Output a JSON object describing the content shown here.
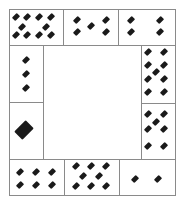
{
  "puzzle": {
    "description": "Ring of cards with diamond pips around an empty center",
    "pip_color": "#1a1a1a",
    "border_color": "#8a8a8a",
    "cards": [
      {
        "id": "top-left",
        "count": 10,
        "box": [
          9,
          9,
          55,
          37
        ],
        "pips": [
          [
            16,
            17
          ],
          [
            27,
            17
          ],
          [
            39,
            17
          ],
          [
            51,
            17
          ],
          [
            22,
            27
          ],
          [
            46,
            27
          ],
          [
            16,
            35
          ],
          [
            27,
            35
          ],
          [
            39,
            35
          ],
          [
            51,
            35
          ]
        ],
        "size": 6
      },
      {
        "id": "top-middle",
        "count": 5,
        "box": [
          63,
          9,
          56,
          37
        ],
        "pips": [
          [
            77,
            20
          ],
          [
            77,
            32
          ],
          [
            91,
            26
          ],
          [
            106,
            20
          ],
          [
            106,
            32
          ]
        ],
        "size": 6
      },
      {
        "id": "top-right",
        "count": 4,
        "box": [
          118,
          9,
          58,
          37
        ],
        "pips": [
          [
            131,
            20
          ],
          [
            131,
            32
          ],
          [
            160,
            20
          ],
          [
            160,
            32
          ]
        ],
        "size": 6
      },
      {
        "id": "left-upper",
        "count": 3,
        "box": [
          9,
          45,
          35,
          58
        ],
        "pips": [
          [
            26,
            60
          ],
          [
            26,
            74
          ],
          [
            26,
            88
          ]
        ],
        "size": 6
      },
      {
        "id": "left-lower",
        "count": 1,
        "box": [
          9,
          102,
          35,
          58
        ],
        "pips": [
          [
            24,
            130
          ]
        ],
        "size": 14
      },
      {
        "id": "right-upper",
        "count": 9,
        "box": [
          141,
          45,
          35,
          59
        ],
        "pips": [
          [
            148,
            52
          ],
          [
            148,
            65
          ],
          [
            148,
            79
          ],
          [
            148,
            92
          ],
          [
            164,
            52
          ],
          [
            164,
            65
          ],
          [
            164,
            79
          ],
          [
            164,
            92
          ],
          [
            156,
            72
          ]
        ],
        "size": 6
      },
      {
        "id": "right-lower",
        "count": 7,
        "box": [
          141,
          103,
          35,
          57
        ],
        "pips": [
          [
            148,
            114
          ],
          [
            148,
            129
          ],
          [
            148,
            146
          ],
          [
            164,
            114
          ],
          [
            164,
            129
          ],
          [
            164,
            146
          ],
          [
            156,
            122
          ]
        ],
        "size": 6
      },
      {
        "id": "bottom-left",
        "count": 6,
        "box": [
          9,
          159,
          56,
          37
        ],
        "pips": [
          [
            20,
            172
          ],
          [
            36,
            172
          ],
          [
            52,
            172
          ],
          [
            20,
            185
          ],
          [
            36,
            185
          ],
          [
            52,
            185
          ]
        ],
        "size": 6
      },
      {
        "id": "bottom-middle",
        "count": 8,
        "box": [
          64,
          159,
          56,
          37
        ],
        "pips": [
          [
            76,
            166
          ],
          [
            91,
            166
          ],
          [
            106,
            166
          ],
          [
            83,
            176
          ],
          [
            99,
            176
          ],
          [
            76,
            186
          ],
          [
            91,
            186
          ],
          [
            106,
            186
          ]
        ],
        "size": 6
      },
      {
        "id": "bottom-right",
        "count": 2,
        "box": [
          119,
          159,
          57,
          37
        ],
        "pips": [
          [
            135,
            179
          ],
          [
            158,
            179
          ]
        ],
        "size": 6
      }
    ]
  }
}
